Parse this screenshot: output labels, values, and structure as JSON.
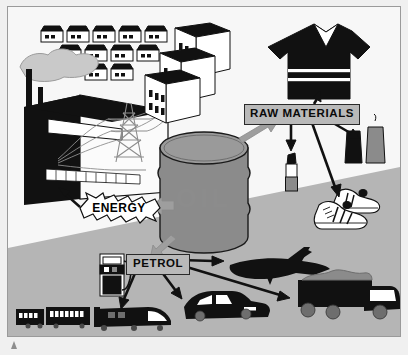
{
  "diagram": {
    "labels": {
      "raw_materials": "RAW MATERIALS",
      "petrol": "PETROL",
      "energy": "ENERGY"
    },
    "central_object": {
      "name": "oil-barrel",
      "caption": "OIL"
    },
    "colors": {
      "background": "#f7f7f7",
      "ground": "#b5b5b5",
      "barrel": "#8b8b8b",
      "label_box": "#b9b9b9",
      "ink": "#111111",
      "frame_border": "#9a9a9a",
      "arrow_gray": "#9e9e9e"
    },
    "branches": [
      {
        "label": "ENERGY",
        "direction": "left",
        "style": "starburst",
        "targets": [
          "power-station",
          "electricity-pylon",
          "office-buildings",
          "houses"
        ]
      },
      {
        "label": "RAW MATERIALS",
        "direction": "upper-right",
        "style": "box",
        "targets": [
          "t-shirt",
          "lipstick",
          "candles",
          "trainers"
        ]
      },
      {
        "label": "PETROL",
        "direction": "lower-left",
        "style": "box",
        "targets": [
          "train",
          "car",
          "aeroplane",
          "truck",
          "petrol-pump"
        ]
      }
    ],
    "objects": {
      "houses_rows": [
        5,
        4,
        2
      ],
      "power_station": "factory with two chimneys and smoke cloud",
      "pylon": "electricity-pylon",
      "office_buildings": 3,
      "tshirt": "rugby-shirt",
      "lipstick": "lipstick",
      "candles": 2,
      "trainers": "pair-of-trainers",
      "petrol_pump": "petrol-pump",
      "train": "train-with-two-carriages",
      "car": "saloon-car",
      "plane": "aeroplane",
      "truck": "tipper-truck"
    }
  }
}
